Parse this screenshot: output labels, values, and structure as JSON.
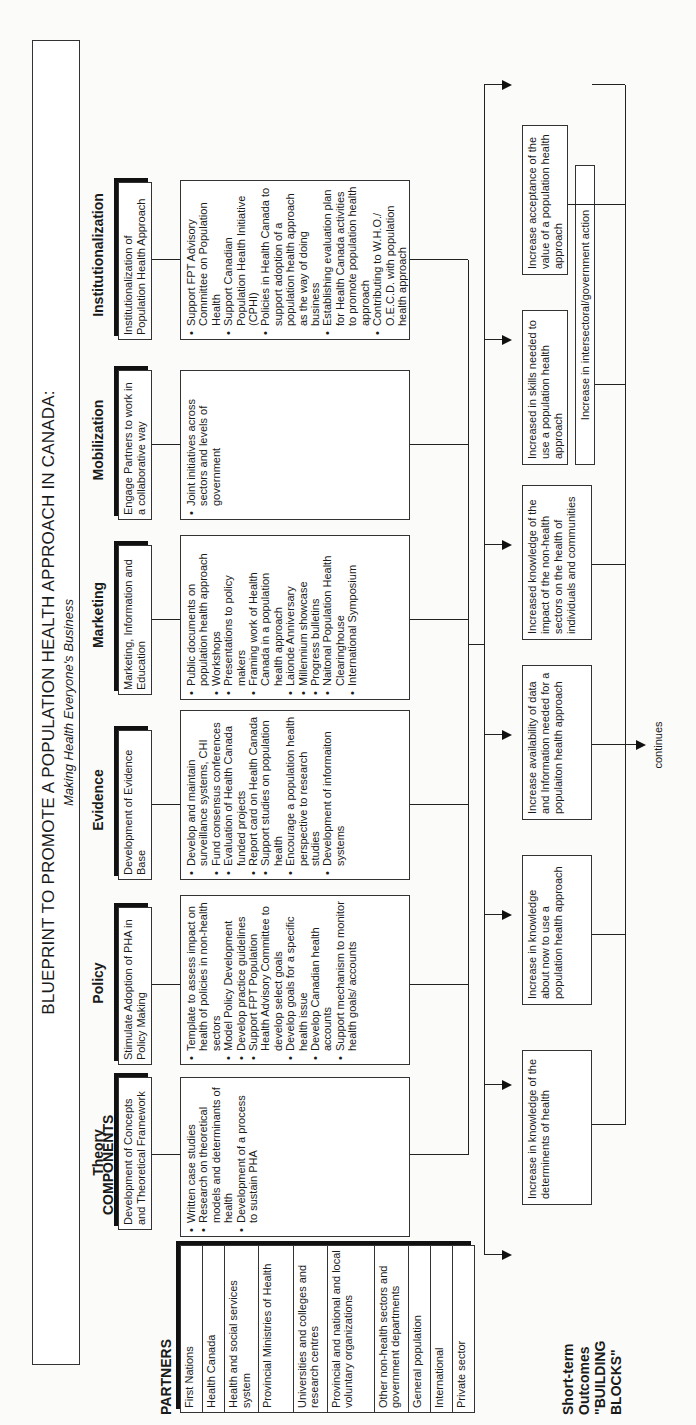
{
  "title": {
    "main": "BLUEPRINT TO PROMOTE A POPULATION HEALTH APPROACH IN CANADA:",
    "subtitle": "Making Health Everyone's Business"
  },
  "labels": {
    "components": "COMPONENTS",
    "partners": "PARTNERS",
    "outcomes_line1": "Short-term Outcomes",
    "outcomes_line2": "\"BUILDING BLOCKS\"",
    "continues": "continues"
  },
  "components": [
    {
      "name": "Theory",
      "description": "Development of Concepts and Theoretical Framework",
      "items": [
        "Written case studies",
        "Research on theoretical models and determinants of health",
        "Development of a process to sustain PHA"
      ]
    },
    {
      "name": "Policy",
      "description": "Stimulate Adoption of PHA in Policy Making",
      "items": [
        "Template to assess impact on health of policies in non-health sectors",
        "Model Policy Development",
        "Develop practice guidelines",
        "Support FPT Population Health Advisory Committee to develop select goals",
        "Develop goals for a specific health issue",
        "Develop Canadian health accounts",
        "Support mechanism to monitor health goals/ accounts"
      ]
    },
    {
      "name": "Evidence",
      "description": "Development of Evidence Base",
      "items": [
        "Develop and maintain surveillance systems, CHI",
        "Fund consensus conferences",
        "Evaluation of Health Canada funded projects",
        "Report card on Health Canada",
        "Support studies on population health",
        "Encourage a population health perspective to research studies",
        "Development of informaiton systems"
      ]
    },
    {
      "name": "Marketing",
      "description": "Marketing, Information and Education",
      "items": [
        "Public documents on population health approach",
        "Workshops",
        "Presentations to policy makers",
        "Framing work of Health Canada in a population health approach",
        "Laionde Anniversary",
        "Millennium showcase",
        "Progress bulletins",
        "Naitonal Population Health Clearinghouse",
        "International Symposium"
      ]
    },
    {
      "name": "Mobilization",
      "description": "Engage Partners to work in a collaborative way",
      "items": [
        "Joint initiatives across sectors and levels of government"
      ]
    },
    {
      "name": "Institutionalization",
      "description": "Institutionalization of Population Health Approach",
      "items": [
        "Support FPT Advisory Committee on Population Health",
        "Support Canadian Population Health Initiative (CPHI)",
        "Policies in Health Canada to support adoption of a population health approach as the way of doing business",
        "Establishing evaluation plan for Health Canada activities to promote population health approach",
        "Contributing to W.H.O./ O.E.C.D. with population health approach"
      ]
    }
  ],
  "partners": [
    "First Nations",
    "Health Canada",
    "Health and social services system",
    "Provincial Ministries of Health",
    "Universities and colleges and research centres",
    "Provincial and national and local voluntary organizations",
    "Other non-health sectors and government departments",
    "General population",
    "International",
    "Private sector"
  ],
  "outcomes": [
    "Increase in knowledge of the determinents of health",
    "Increase in knowledge about now to use a population health approach",
    "Increase availability of data and Information needed for a populaiton health approach",
    "Increased knowledge of the impact of the non-health sectors on the health of individuals and communities",
    "Increased in skills needed to use a population health approach",
    "Increase acceptance of the value of a population health approach",
    "Increase in supportive environments for the use of a population health approach"
  ],
  "intersectoral_outcome": "Increase in intersectoral/government action"
}
